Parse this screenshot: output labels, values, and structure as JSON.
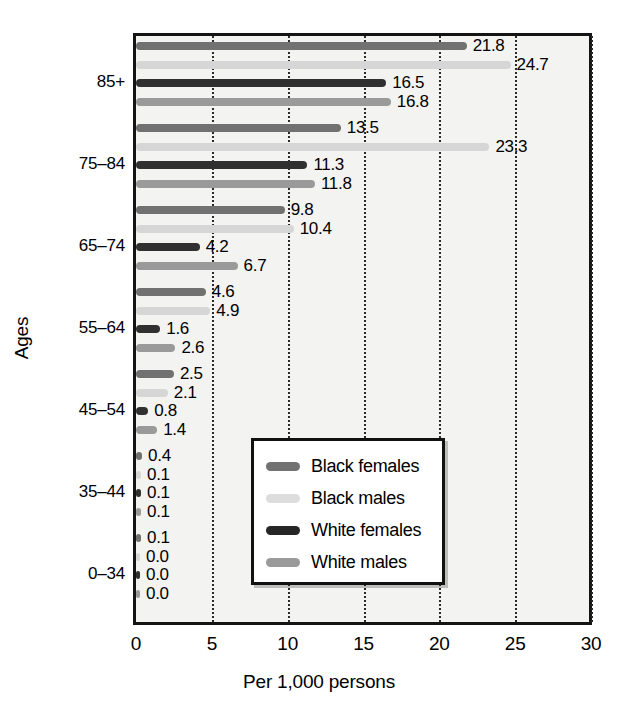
{
  "chart_data": {
    "type": "bar",
    "orientation": "horizontal",
    "title": "",
    "xlabel": "Per 1,000 persons",
    "ylabel": "Ages",
    "xlim": [
      0,
      30
    ],
    "xticks": [
      0,
      5,
      10,
      15,
      20,
      25,
      30
    ],
    "xtick_labels": [
      "0",
      "5",
      "10",
      "15",
      "20",
      "25",
      "30"
    ],
    "grid": true,
    "grid_axis": "x",
    "legend_position": "lower right",
    "categories": [
      "85+",
      "75–84",
      "65–74",
      "55–64",
      "45–54",
      "35–44",
      "0–34"
    ],
    "series": [
      {
        "name": "Black females",
        "color": "#717171",
        "values": [
          21.8,
          13.5,
          9.8,
          4.6,
          2.5,
          0.4,
          0.1
        ],
        "value_labels": [
          "21.8",
          "13.5",
          "9.8",
          "4.6",
          "2.5",
          "0.4",
          "0.1"
        ]
      },
      {
        "name": "Black males",
        "color": "#d6d6d6",
        "values": [
          24.7,
          23.3,
          10.4,
          4.9,
          2.1,
          0.1,
          0.0
        ],
        "value_labels": [
          "24.7",
          "23.3",
          "10.4",
          "4.9",
          "2.1",
          "0.1",
          "0.0"
        ]
      },
      {
        "name": "White females",
        "color": "#303030",
        "values": [
          16.5,
          11.3,
          4.2,
          1.6,
          0.8,
          0.1,
          0.0
        ],
        "value_labels": [
          "16.5",
          "11.3",
          "4.2",
          "1.6",
          "0.8",
          "0.1",
          "0.0"
        ]
      },
      {
        "name": "White males",
        "color": "#9a9a9a",
        "values": [
          16.8,
          11.8,
          6.7,
          2.6,
          1.4,
          0.1,
          0.0
        ],
        "value_labels": [
          "16.8",
          "11.8",
          "6.7",
          "2.6",
          "1.4",
          "0.1",
          "0.0"
        ]
      }
    ]
  },
  "axes": {
    "x_title": "Per 1,000 persons",
    "y_title": "Ages",
    "x_tick_labels": [
      "0",
      "5",
      "10",
      "15",
      "20",
      "25",
      "30"
    ],
    "y_tick_labels": [
      "85+",
      "75–84",
      "65–74",
      "55–64",
      "45–54",
      "35–44",
      "0–34"
    ]
  },
  "legend": {
    "entries": [
      {
        "label": "Black females",
        "color": "#717171"
      },
      {
        "label": "Black males",
        "color": "#dddddd"
      },
      {
        "label": "White females",
        "color": "#262626"
      },
      {
        "label": "White males",
        "color": "#9a9a9a"
      }
    ]
  }
}
